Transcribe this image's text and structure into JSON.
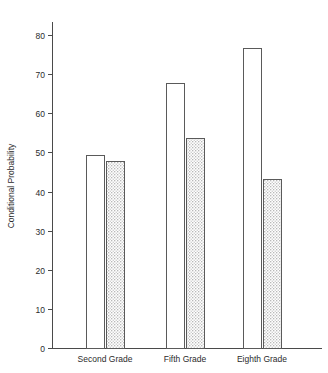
{
  "chart_data": {
    "type": "bar",
    "title": "",
    "subtitle": "",
    "xlabel": "",
    "ylabel": "Conditional Probability",
    "categories": [
      "Second Grade",
      "Fifth Grade",
      "Eighth Grade"
    ],
    "series": [
      {
        "name": "open",
        "style": "open-white",
        "values": [
          49.4,
          67.8,
          76.7
        ]
      },
      {
        "name": "stippled",
        "style": "dotted-fill",
        "values": [
          47.8,
          53.7,
          43.2
        ]
      }
    ],
    "ylim": [
      0,
      85
    ],
    "yticks": [
      0,
      10,
      20,
      30,
      40,
      50,
      60,
      70,
      80
    ],
    "ytick_labels": [
      "0",
      "10",
      "20",
      "30",
      "40",
      "50",
      "60",
      "70",
      "80"
    ],
    "grid": false,
    "legend": "none",
    "axis_color": "#4a4a4a",
    "bar_edge_color": "#5a5a5a",
    "bar_open_fill": "#ffffff",
    "bar_dotted_fill": "#e6e6e6",
    "background": "#ffffff"
  },
  "geometry": {
    "plot_left": 52,
    "plot_right": 322,
    "baseline_y": 348,
    "axis_top_y": 22,
    "value_per_pixel_ref": {
      "y_at_0": 348,
      "y_at_80": 35
    },
    "bar_width": 18,
    "group_centers": [
      105,
      185,
      262
    ],
    "bar_gap": 2
  }
}
